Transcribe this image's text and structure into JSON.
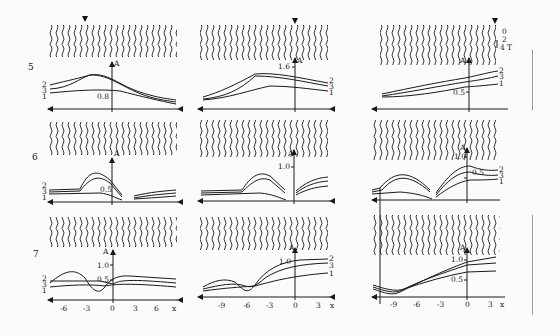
{
  "figure": {
    "rows": [
      {
        "label": "5",
        "panels": [
          {
            "marker_x": -3,
            "y_tick": "0.8",
            "curve_labels": [
              "2",
              "3",
              "1"
            ],
            "curve_label_side": "left"
          },
          {
            "marker_x": 0,
            "y_tick": "1.6",
            "curve_labels": [
              "2",
              "3",
              "1"
            ],
            "curve_label_side": "right"
          },
          {
            "marker_x": 3,
            "y_tick": "0.5",
            "curve_labels": [
              "2",
              "3",
              "1"
            ],
            "curve_label_side": "right",
            "time_scale": {
              "ticks": [
                "0",
                "2",
                "4"
              ],
              "unit": "T"
            }
          }
        ]
      },
      {
        "label": "6",
        "panels": [
          {
            "y_tick": "0.5",
            "curve_labels": [
              "2",
              "3",
              "1"
            ],
            "curve_label_side": "both"
          },
          {
            "y_tick": "1.0",
            "curve_labels": [
              "2",
              "3",
              "1"
            ],
            "curve_label_side": "both"
          },
          {
            "y_tick": "1.0",
            "y_tick2": "0.5",
            "curve_labels": [
              "2",
              "3",
              "1"
            ],
            "curve_label_side": "both"
          }
        ]
      },
      {
        "label": "7",
        "panels": [
          {
            "y_ticks": [
              "1.0",
              "0.5"
            ],
            "x_ticks": [
              "-6",
              "-3",
              "0",
              "3",
              "6"
            ],
            "curve_labels": [
              "2",
              "3",
              "1"
            ],
            "curve_label_side": "left"
          },
          {
            "y_ticks": [
              "1.0"
            ],
            "x_ticks": [
              "-9",
              "-6",
              "-3",
              "0",
              "3"
            ],
            "curve_labels": [
              "2",
              "3",
              "1"
            ],
            "curve_label_side": "right"
          },
          {
            "y_ticks": [
              "1.0",
              "0.5"
            ],
            "x_ticks": [
              "-9",
              "-6",
              "-3",
              "0",
              "3"
            ],
            "curve_labels": [
              "3"
            ],
            "curve_label_side": "left"
          }
        ]
      }
    ],
    "axis_labels": {
      "y": "A",
      "x": "x"
    }
  }
}
